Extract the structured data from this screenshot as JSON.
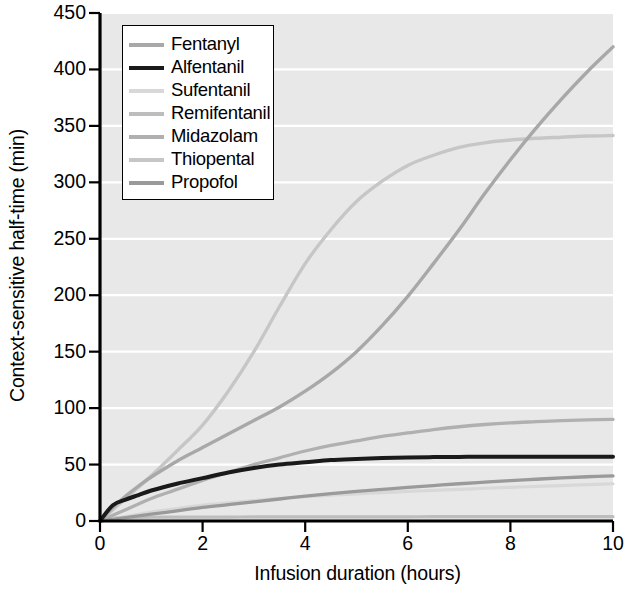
{
  "chart_data": {
    "type": "line",
    "title": "",
    "xlabel": "Infusion duration (hours)",
    "ylabel": "Context-sensitive half-time (min)",
    "xlim": [
      0,
      10
    ],
    "ylim": [
      0,
      450
    ],
    "xticks": [
      "0",
      "2",
      "4",
      "6",
      "8",
      "10"
    ],
    "xtick_values": [
      0,
      2,
      4,
      6,
      8,
      10
    ],
    "yticks": [
      "0",
      "50",
      "100",
      "150",
      "200",
      "250",
      "300",
      "350",
      "400",
      "450"
    ],
    "ytick_values": [
      0,
      50,
      100,
      150,
      200,
      250,
      300,
      350,
      400,
      450
    ],
    "grid": "horizontal",
    "grid_color": "#ffffff",
    "plot_bg": "#e8e8e8",
    "legend_position": "upper left",
    "x": [
      0,
      0.25,
      0.5,
      0.75,
      1,
      1.5,
      2,
      2.5,
      3,
      3.5,
      4,
      4.5,
      5,
      5.5,
      6,
      6.5,
      7,
      7.5,
      8,
      8.5,
      9,
      9.5,
      10
    ],
    "series": [
      {
        "name": "Fentanyl",
        "color": "#a8a8a8",
        "width": 3.4,
        "values": [
          0,
          12,
          22,
          31,
          39,
          53,
          65,
          77,
          89,
          101,
          115,
          131,
          150,
          173,
          199,
          228,
          258,
          290,
          320,
          348,
          374,
          398,
          420
        ]
      },
      {
        "name": "Alfentanil",
        "color": "#1a1a1a",
        "width": 4.0,
        "values": [
          0,
          14,
          19,
          23,
          27,
          33,
          38,
          43,
          47,
          50,
          52,
          54,
          55,
          55.8,
          56.3,
          56.6,
          56.8,
          57,
          57,
          57,
          57,
          57,
          57
        ]
      },
      {
        "name": "Sufentanil",
        "color": "#d8d8d8",
        "width": 3.2,
        "values": [
          0,
          2,
          4,
          6,
          8,
          11,
          14,
          16,
          18,
          20,
          21.5,
          23,
          24,
          25.2,
          26.2,
          27.2,
          28,
          29,
          29.8,
          30.6,
          31.4,
          32.2,
          33
        ]
      },
      {
        "name": "Remifentanil",
        "color": "#bdbdbd",
        "width": 3.2,
        "values": [
          0,
          2.6,
          3,
          3.2,
          3.3,
          3.4,
          3.5,
          3.5,
          3.6,
          3.6,
          3.6,
          3.7,
          3.7,
          3.7,
          3.7,
          3.8,
          3.8,
          3.8,
          3.8,
          3.8,
          3.8,
          3.8,
          3.8
        ]
      },
      {
        "name": "Midazolam",
        "color": "#b0b0b0",
        "width": 3.3,
        "values": [
          0,
          5,
          10,
          15,
          20,
          28,
          36,
          43,
          50,
          56,
          62,
          67,
          71,
          75,
          78,
          81,
          83.5,
          85.5,
          87,
          88,
          89,
          89.6,
          90
        ]
      },
      {
        "name": "Thiopental",
        "color": "#c6c6c6",
        "width": 3.4,
        "values": [
          0,
          10,
          20,
          30,
          40,
          62,
          85,
          115,
          150,
          190,
          228,
          258,
          283,
          301,
          315,
          324,
          331,
          335,
          337.5,
          339,
          340,
          341,
          341.5
        ]
      },
      {
        "name": "Propofol",
        "color": "#9a9a9a",
        "width": 3.3,
        "values": [
          0,
          1.5,
          3,
          4.5,
          6,
          9,
          12,
          14.5,
          17,
          19.5,
          22,
          24.2,
          26.2,
          28,
          29.8,
          31.4,
          33,
          34.4,
          35.8,
          37,
          38.2,
          39.2,
          40
        ]
      }
    ]
  }
}
